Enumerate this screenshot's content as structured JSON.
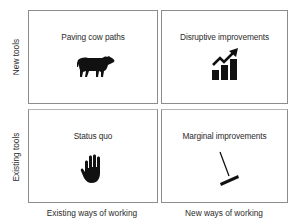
{
  "diagram": {
    "type": "2x2-matrix",
    "y_axis": {
      "top_label": "New tools",
      "bottom_label": "Existing tools"
    },
    "x_axis": {
      "left_label": "Existing ways of working",
      "right_label": "New ways of working"
    },
    "quadrants": {
      "top_left": {
        "label": "Paving cow paths",
        "icon": "cow-icon"
      },
      "top_right": {
        "label": "Disruptive improvements",
        "icon": "rising-chart-icon"
      },
      "bottom_left": {
        "label": "Status quo",
        "icon": "hand-stop-icon"
      },
      "bottom_right": {
        "label": "Marginal improvements",
        "icon": "rake-icon"
      }
    },
    "colors": {
      "border": "#8c8c8c",
      "text": "#2b2b2b",
      "icon": "#111111"
    }
  }
}
